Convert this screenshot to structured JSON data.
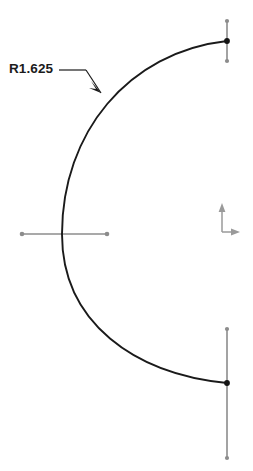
{
  "drawing": {
    "type": "cad-sketch",
    "background_color": "#ffffff",
    "geometry_color": "#1a1a1a",
    "construction_color": "#8c8c8c",
    "endpoint_color": "#1a1a1a",
    "axis_color": "#9a9a9a"
  },
  "dimension": {
    "label": "R1.625",
    "kind": "radius",
    "value": 1.625,
    "prefix": "R",
    "leader": {
      "text_anchor_x": 57,
      "text_anchor_y": 70,
      "elbow_x": 86,
      "elbow_y": 70,
      "tip_x": 101,
      "tip_y": 93,
      "arrowhead": "filled"
    }
  },
  "arc": {
    "name": "main-arc",
    "start_x": 227,
    "start_y": 41,
    "end_x": 227,
    "end_y": 383,
    "leftmost_x": 62,
    "center_y": 234,
    "sweep": "left-bulge",
    "stroke_width": 1.9
  },
  "construction_lines": [
    {
      "name": "top-vertical-construction-line",
      "x1": 227,
      "y1": 21,
      "x2": 227,
      "y2": 61,
      "orientation": "vertical"
    },
    {
      "name": "bottom-vertical-construction-line",
      "x1": 227,
      "y1": 329,
      "x2": 227,
      "y2": 458,
      "orientation": "vertical"
    },
    {
      "name": "horizontal-centerline",
      "x1": 22,
      "y1": 234,
      "x2": 107,
      "y2": 234,
      "orientation": "horizontal"
    }
  ],
  "endpoints": [
    {
      "name": "arc-top-endpoint",
      "x": 227,
      "y": 41,
      "style": "solid"
    },
    {
      "name": "arc-bottom-endpoint",
      "x": 227,
      "y": 383,
      "style": "solid"
    },
    {
      "name": "top-line-upper-handle",
      "x": 227,
      "y": 21,
      "style": "hollow"
    },
    {
      "name": "top-line-lower-handle",
      "x": 227,
      "y": 61,
      "style": "hollow"
    },
    {
      "name": "bottom-line-upper-handle",
      "x": 227,
      "y": 329,
      "style": "hollow"
    },
    {
      "name": "bottom-line-lower-handle",
      "x": 227,
      "y": 458,
      "style": "hollow"
    },
    {
      "name": "centerline-left-handle",
      "x": 22,
      "y": 234,
      "style": "hollow"
    },
    {
      "name": "centerline-right-handle",
      "x": 107,
      "y": 234,
      "style": "hollow"
    }
  ],
  "origin_indicator": {
    "name": "xy-axis-triad",
    "origin_x": 222,
    "origin_y": 232,
    "y_axis_tip_y": 205,
    "x_axis_tip_x": 240,
    "x_label": "",
    "y_label": ""
  }
}
